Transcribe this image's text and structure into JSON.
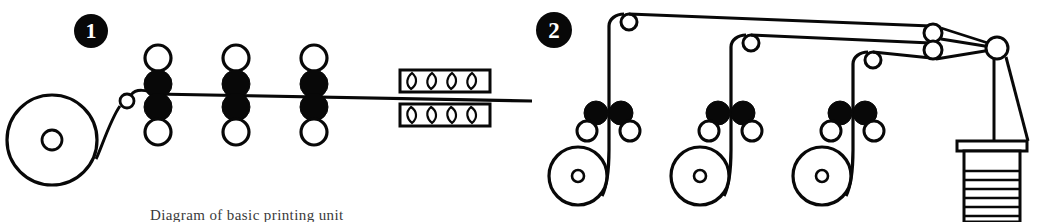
{
  "figure": {
    "caption": "Diagram of basic printing unit",
    "ink_color": "#080808",
    "paper_color": "#ffffff",
    "width": 1064,
    "height": 222
  },
  "panels": [
    {
      "number": "1",
      "name": "horizontal-web-press",
      "label": "Horizontal web offset press with dryer",
      "components": {
        "roll_stand": {
          "label": "Paper roll stand",
          "hub_label": "Core",
          "cx": 52,
          "cy": 140,
          "r": 45,
          "hub_r": 10
        },
        "lead_idler": {
          "label": "Lead-in idler roller",
          "cx": 127,
          "cy": 101,
          "r": 7
        },
        "print_units": [
          {
            "label": "Print unit 1",
            "x": 158,
            "top_idler_cy": 58,
            "upper_blanket_cy": 84,
            "lower_blanket_cy": 107,
            "bottom_idler_cy": 132
          },
          {
            "label": "Print unit 2",
            "x": 236,
            "top_idler_cy": 58,
            "upper_blanket_cy": 84,
            "lower_blanket_cy": 107,
            "bottom_idler_cy": 132
          },
          {
            "label": "Print unit 3",
            "x": 314,
            "top_idler_cy": 58,
            "upper_blanket_cy": 84,
            "lower_blanket_cy": 107,
            "bottom_idler_cy": 132
          }
        ],
        "dryer": {
          "label": "Gas dryer / oven",
          "upper_box": {
            "x": 400,
            "y": 70,
            "w": 90,
            "h": 22
          },
          "lower_box": {
            "x": 400,
            "y": 98,
            "w": 90,
            "h": 22
          },
          "burner_count": 4,
          "burner_label": "Burner flame"
        },
        "web": {
          "label": "Paper web",
          "exit_x": 532
        }
      }
    },
    {
      "number": "2",
      "name": "vertical-multi-web-press",
      "label": "Three-web press with angle bars and folder",
      "components": {
        "stations": [
          {
            "label": "Web station 1",
            "roll": {
              "cx": 46,
              "cy": 176,
              "r": 29,
              "hub_r": 6,
              "label": "Paper roll 1"
            },
            "blanket_left": {
              "cx": 64,
              "cy": 113,
              "r": 12,
              "label": "Blanket cylinder left"
            },
            "blanket_right": {
              "cx": 89,
              "cy": 113,
              "r": 12,
              "label": "Blanket cylinder right"
            },
            "idler_left": {
              "cx": 55,
              "cy": 131,
              "r": 10,
              "label": "Idler roller left"
            },
            "idler_right": {
              "cx": 98,
              "cy": 131,
              "r": 10,
              "label": "Idler roller right"
            },
            "web_x": 77,
            "turn_idler": {
              "cx": 97,
              "cy": 22,
              "r": 8,
              "label": "Turning idler 1"
            },
            "run_y": 19
          },
          {
            "label": "Web station 2",
            "roll": {
              "cx": 168,
              "cy": 176,
              "r": 29,
              "hub_r": 6,
              "label": "Paper roll 2"
            },
            "blanket_left": {
              "cx": 186,
              "cy": 113,
              "r": 12,
              "label": "Blanket cylinder left"
            },
            "blanket_right": {
              "cx": 211,
              "cy": 113,
              "r": 12,
              "label": "Blanket cylinder right"
            },
            "idler_left": {
              "cx": 177,
              "cy": 131,
              "r": 10,
              "label": "Idler roller left"
            },
            "idler_right": {
              "cx": 220,
              "cy": 131,
              "r": 10,
              "label": "Idler roller right"
            },
            "web_x": 199,
            "turn_idler": {
              "cx": 219,
              "cy": 43,
              "r": 8,
              "label": "Turning idler 2"
            },
            "run_y": 40
          },
          {
            "label": "Web station 3",
            "roll": {
              "cx": 290,
              "cy": 176,
              "r": 29,
              "hub_r": 6,
              "label": "Paper roll 3"
            },
            "blanket_left": {
              "cx": 308,
              "cy": 113,
              "r": 12,
              "label": "Blanket cylinder left"
            },
            "blanket_right": {
              "cx": 333,
              "cy": 113,
              "r": 12,
              "label": "Blanket cylinder right"
            },
            "idler_left": {
              "cx": 299,
              "cy": 131,
              "r": 10,
              "label": "Idler roller left"
            },
            "idler_right": {
              "cx": 342,
              "cy": 131,
              "r": 10,
              "label": "Idler roller right"
            },
            "web_x": 321,
            "turn_idler": {
              "cx": 341,
              "cy": 60,
              "r": 8,
              "label": "Turning idler 3"
            },
            "run_y": 57
          }
        ],
        "angle_bars": [
          {
            "cx": 401,
            "cy": 33,
            "r": 9,
            "label": "Angle bar upper"
          },
          {
            "cx": 401,
            "cy": 50,
            "r": 9,
            "label": "Angle bar lower"
          }
        ],
        "former_roller": {
          "label": "Former / nip roller",
          "cx": 465,
          "cy": 48,
          "r": 11
        },
        "folder": {
          "label": "Folder delivery stack",
          "box": {
            "x": 432,
            "y": 152,
            "w": 56,
            "h": 70
          },
          "top_bar": {
            "x": 425,
            "y": 141,
            "w": 70,
            "h": 9
          },
          "fold_line_count": 8,
          "fold_label": "Folded signature"
        },
        "chute": {
          "label": "Delivery chute",
          "points": "465,60 465,141 497,141 477,116"
        }
      }
    }
  ]
}
